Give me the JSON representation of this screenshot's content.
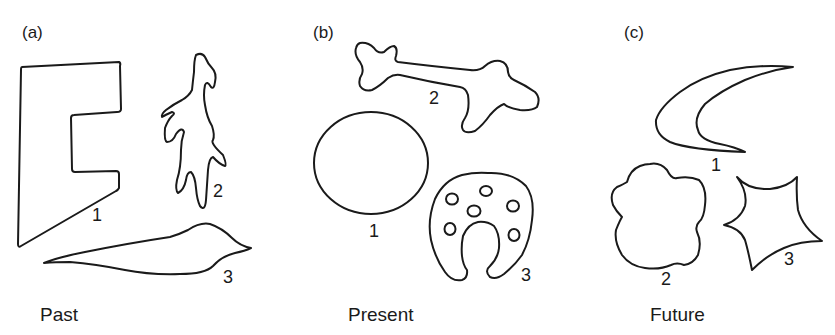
{
  "figure": {
    "panels": [
      {
        "id": "a",
        "label": "(a)",
        "caption": "Past",
        "shapes": [
          {
            "number": "1",
            "description": "angular E-like block"
          },
          {
            "number": "2",
            "description": "branched lizard-like form"
          },
          {
            "number": "3",
            "description": "elongated leaf/spindle"
          }
        ]
      },
      {
        "id": "b",
        "label": "(b)",
        "caption": "Present",
        "shapes": [
          {
            "number": "1",
            "description": "circle"
          },
          {
            "number": "2",
            "description": "bone-like elongated form"
          },
          {
            "number": "3",
            "description": "horseshoe with spots"
          }
        ]
      },
      {
        "id": "c",
        "label": "(c)",
        "caption": "Future",
        "shapes": [
          {
            "number": "1",
            "description": "crescent / boomerang"
          },
          {
            "number": "2",
            "description": "cloud-like rounded form"
          },
          {
            "number": "3",
            "description": "concave four-pointed star"
          }
        ]
      }
    ]
  },
  "colors": {
    "stroke": "#1a1a1a",
    "background": "#ffffff"
  }
}
